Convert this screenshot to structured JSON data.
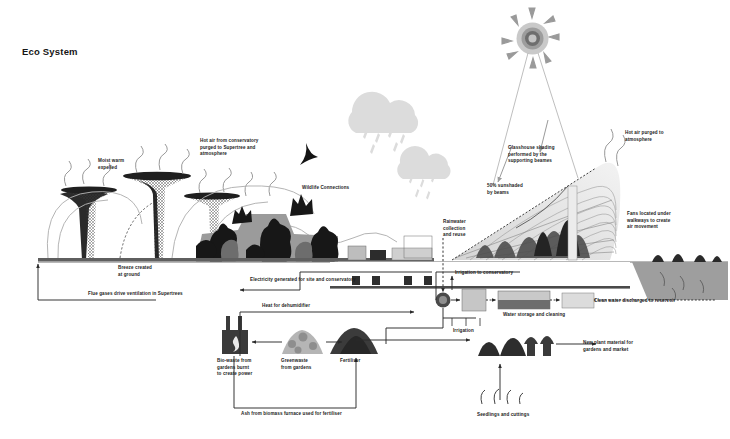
{
  "page": {
    "title": "Eco System",
    "width": 730,
    "height": 439,
    "background": "#ffffff"
  },
  "palette": {
    "ink": "#1c1c1c",
    "line": "#2b2b2b",
    "cloud": "#d9d9d9",
    "sun": "#9a9a9a",
    "ground": "#6f6f6f",
    "vegetation_dark": "#1e1e1e",
    "vegetation_mid": "#8f8f8f",
    "glass_light": "#e6e6e6",
    "embankment": "#9e9e9e",
    "tank": "#bdbdbd",
    "tank_dark": "#6a6a6a",
    "furnace": "#3a3a3a"
  },
  "labels": {
    "moist_warm": "Moist warm\nexpelled",
    "hot_air_conservatory": "Hot air from conservatory\npurged to Supertree and\natmosphere",
    "wildlife": "Wildlife Connections",
    "breeze": "Breeze created\nat ground",
    "flue_gases": "Flue gases drive ventilation in Supertrees",
    "electricity": "Electricity generated for site and conservatory",
    "heat_dehumidifier": "Heat for dehumidifier",
    "biowaste": "Bio-waste from\ngardens burnt\nto create power",
    "greenwaste": "Greenwaste\nfrom gardens",
    "fertiliser": "Fertiliser",
    "ash": "Ash from biomass furnace used for fertiliser",
    "glasshouse_shading": "Glasshouse shading\nperformed by the\nsupporting beames",
    "sunshaded": "50% sunshaded\nby beams",
    "rainwater": "Rainwater\ncollection\nand reuse",
    "hot_air_purged": "Hot air purged to\natmosphere",
    "fans": "Fans located under\nwalkways to create\nair movement",
    "irrigation_conservatory": "Irrigation to conservatory",
    "water_storage": "Water storage and cleaning",
    "clean_water": "Clean water discharged to reservoir",
    "irrigation": "Irrigation",
    "new_plant": "New plant material for\ngardens and market",
    "seedlings": "Seedlings and cuttings"
  },
  "icons": {
    "sun": "sun-icon",
    "cloud_left": "cloud-rain-icon",
    "cloud_right": "cloud-rain-icon",
    "furnace": "biomass-furnace-icon",
    "pump": "pump-node-icon",
    "supertree": "supertree-icon",
    "glasshouse": "glasshouse-icon",
    "bird": "bird-icon"
  }
}
